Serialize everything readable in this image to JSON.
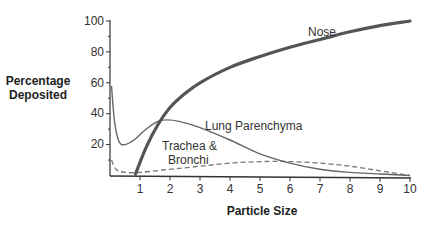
{
  "chart_data": {
    "type": "line",
    "title": "",
    "xlabel": "Particle Size",
    "ylabel": [
      "Percentage",
      "Deposited"
    ],
    "xlim": [
      0,
      10
    ],
    "ylim": [
      0,
      100
    ],
    "x_ticks": [
      1,
      2,
      3,
      4,
      5,
      6,
      7,
      8,
      9,
      10
    ],
    "y_ticks": [
      20,
      40,
      60,
      80,
      100
    ],
    "y_minor_step": 10,
    "grid": false,
    "legend": "none (inline curve labels)",
    "series": [
      {
        "name": "Nose",
        "style": "thick solid",
        "color": "#555555",
        "x": [
          0.85,
          1.2,
          1.6,
          2.0,
          2.5,
          3.0,
          4.0,
          5.0,
          6.0,
          7.0,
          8.0,
          9.0,
          10.0
        ],
        "y": [
          1,
          18,
          33,
          44,
          53,
          60,
          70,
          77,
          83,
          88,
          93,
          97,
          100
        ]
      },
      {
        "name": "Lung Parenchyma",
        "style": "thin solid",
        "color": "#666666",
        "x": [
          0.05,
          0.15,
          0.3,
          0.5,
          0.8,
          1.2,
          1.6,
          1.9,
          2.3,
          3.0,
          4.0,
          5.0,
          6.0,
          7.0,
          8.0,
          9.0,
          10.0
        ],
        "y": [
          58,
          35,
          22,
          20,
          23,
          30,
          35,
          36,
          35,
          31,
          23,
          14,
          8,
          4,
          2,
          1,
          0
        ]
      },
      {
        "name": "Trachea & Bronchi",
        "style": "dashed",
        "color": "#777777",
        "x": [
          0.05,
          0.2,
          0.5,
          1.0,
          2.0,
          3.0,
          4.0,
          5.0,
          6.0,
          7.0,
          8.0,
          9.0,
          10.0
        ],
        "y": [
          10,
          4,
          2,
          2,
          4,
          6,
          8,
          9,
          9,
          8,
          6,
          3,
          0
        ]
      }
    ],
    "annotations": [
      {
        "text": "Nose",
        "x": 4.1,
        "y": 88
      },
      {
        "text": "Lung Parenchyma",
        "x": 3.1,
        "y": 34
      },
      {
        "text": "Trachea &",
        "x": 2.6,
        "y": 22
      },
      {
        "text": "Bronchi",
        "x": 2.6,
        "y": 12
      }
    ]
  },
  "labels": {
    "ylabel_line1": "Percentage",
    "ylabel_line2": "Deposited",
    "xlabel": "Particle Size",
    "nose": "Nose",
    "lung": "Lung Parenchyma",
    "trachea_1": "Trachea &",
    "trachea_2": "Bronchi",
    "xt": [
      "1",
      "2",
      "3",
      "4",
      "5",
      "6",
      "7",
      "8",
      "9",
      "10"
    ],
    "yt": [
      "20",
      "40",
      "60",
      "80",
      "100"
    ]
  }
}
